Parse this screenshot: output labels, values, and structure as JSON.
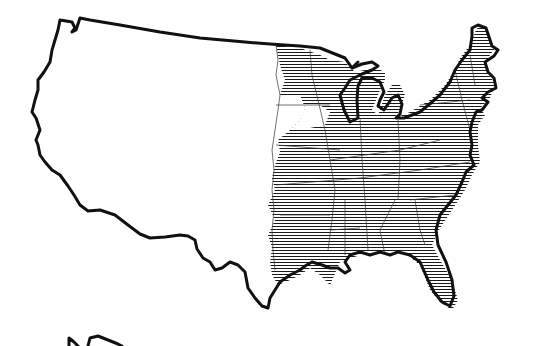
{
  "map": {
    "type": "choropleth-hatched",
    "subject": "United States outline map with horizontal line shading over eastern region",
    "colors": {
      "background": "#ffffff",
      "outline": "#111111",
      "hatch": "#1a1a1a",
      "state_boundaries": "#333333"
    },
    "legend": [],
    "labels": [],
    "shaded_region": "Eastern United States (approx. east of the Great Plains, excluding most of Iowa)",
    "unshaded_region": "Western United States",
    "hatch_style": "horizontal lines",
    "partial_fragment": "Second map outline partially visible at bottom-left edge"
  }
}
